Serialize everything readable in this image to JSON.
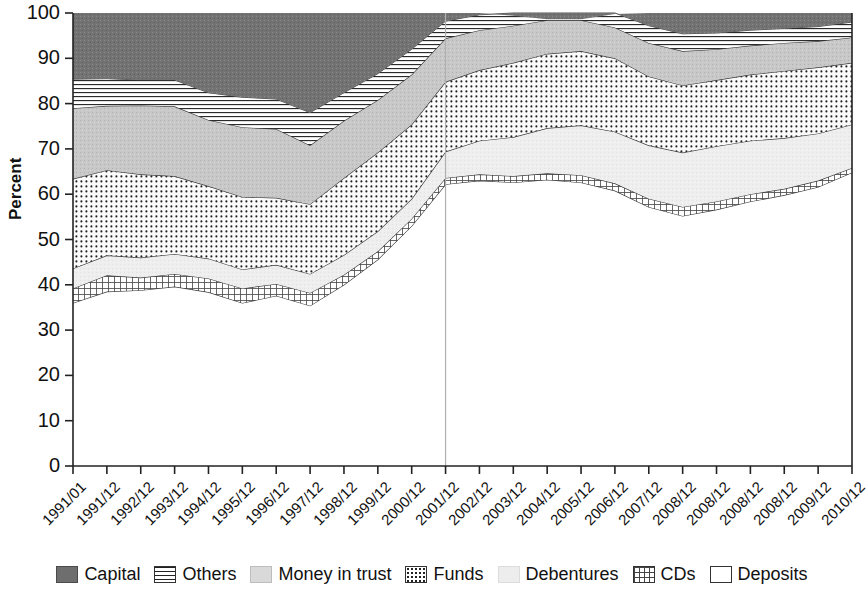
{
  "chart_data": {
    "type": "area",
    "stacked": true,
    "title": "",
    "xlabel": "",
    "ylabel": "Percent",
    "ylim": [
      0,
      100
    ],
    "ytick_step": 10,
    "yticks": [
      0,
      10,
      20,
      30,
      40,
      50,
      60,
      70,
      80,
      90,
      100
    ],
    "grid": false,
    "legend_position": "bottom",
    "categories": [
      "1991/01",
      "1991/12",
      "1992/12",
      "1993/12",
      "1994/12",
      "1995/12",
      "1996/12",
      "1997/12",
      "1998/12",
      "1999/12",
      "2000/12",
      "2001/12",
      "2002/12",
      "2003/12",
      "2004/12",
      "2005/12",
      "2006/12",
      "2007/12",
      "2008/12",
      "2008/12",
      "2008/12",
      "2008/12",
      "2009/12",
      "2010/12"
    ],
    "stack_order_bottom_to_top": [
      "Deposits",
      "CDs",
      "Debentures",
      "Funds",
      "Money in trust",
      "Others",
      "Capital"
    ],
    "series": [
      {
        "name": "Deposits",
        "pattern": "solid-white",
        "color": "#ffffff",
        "values": [
          36.0,
          38.5,
          38.8,
          39.6,
          38.4,
          36.0,
          37.6,
          35.4,
          40.0,
          45.6,
          53.0,
          62.2,
          63.0,
          62.6,
          63.2,
          62.6,
          60.8,
          57.2,
          55.2,
          56.6,
          58.4,
          59.8,
          61.6,
          64.8
        ]
      },
      {
        "name": "CDs",
        "pattern": "grid",
        "color": "#f2f2f2",
        "values": [
          3.2,
          3.6,
          2.8,
          2.8,
          3.0,
          3.2,
          2.6,
          2.8,
          2.2,
          1.8,
          1.6,
          1.4,
          1.4,
          1.4,
          1.4,
          1.6,
          1.6,
          1.8,
          2.0,
          1.8,
          1.6,
          1.4,
          1.4,
          1.0
        ]
      },
      {
        "name": "Debentures",
        "pattern": "light-stipple",
        "color": "#ececec",
        "values": [
          4.4,
          4.4,
          4.4,
          4.4,
          4.4,
          4.2,
          4.2,
          4.2,
          4.4,
          4.4,
          4.4,
          5.8,
          7.4,
          8.6,
          10.0,
          11.0,
          11.4,
          11.8,
          12.0,
          12.2,
          11.8,
          11.2,
          10.4,
          9.6
        ]
      },
      {
        "name": "Funds",
        "pattern": "dotted",
        "color": "#f7f7f7",
        "values": [
          19.8,
          18.8,
          18.4,
          17.2,
          16.0,
          16.0,
          14.8,
          15.4,
          17.0,
          17.4,
          16.4,
          15.4,
          15.6,
          16.4,
          16.4,
          16.4,
          16.2,
          15.2,
          14.8,
          14.6,
          14.6,
          14.8,
          14.6,
          13.6
        ]
      },
      {
        "name": "Money in trust",
        "pattern": "medium-gray-stipple",
        "color": "#c9c9c9",
        "values": [
          15.6,
          14.2,
          15.2,
          15.4,
          14.6,
          15.4,
          15.2,
          13.0,
          12.6,
          11.6,
          11.0,
          9.6,
          8.8,
          8.2,
          7.4,
          6.8,
          6.8,
          7.4,
          7.6,
          6.8,
          6.4,
          6.2,
          5.8,
          5.6
        ]
      },
      {
        "name": "Others",
        "pattern": "horizontal-lines",
        "color": "#ffffff",
        "values": [
          6.4,
          6.0,
          5.6,
          5.8,
          6.0,
          6.6,
          6.6,
          7.2,
          6.2,
          5.8,
          5.6,
          3.8,
          3.4,
          3.4,
          3.0,
          3.0,
          3.4,
          3.8,
          3.8,
          3.6,
          3.4,
          3.2,
          3.2,
          3.4
        ]
      },
      {
        "name": "Capital",
        "pattern": "dark-solid",
        "color": "#6e6e6e",
        "values": [
          14.6,
          14.5,
          14.8,
          14.8,
          17.6,
          18.6,
          19.0,
          22.0,
          17.6,
          13.4,
          8.0,
          1.8,
          0.4,
          -0.6,
          -1.4,
          -1.4,
          -0.2,
          2.8,
          4.6,
          4.4,
          3.8,
          3.4,
          3.0,
          2.0
        ]
      }
    ],
    "reference_line": {
      "at_category": "2001/12",
      "color": "#b0b0b0"
    }
  },
  "legend": {
    "items": [
      {
        "label": "Capital",
        "swatch": "capital"
      },
      {
        "label": "Others",
        "swatch": "others"
      },
      {
        "label": "Money in trust",
        "swatch": "moneyintrust"
      },
      {
        "label": "Funds",
        "swatch": "funds"
      },
      {
        "label": "Debentures",
        "swatch": "debentures"
      },
      {
        "label": "CDs",
        "swatch": "cds"
      },
      {
        "label": "Deposits",
        "swatch": "deposits"
      }
    ]
  }
}
